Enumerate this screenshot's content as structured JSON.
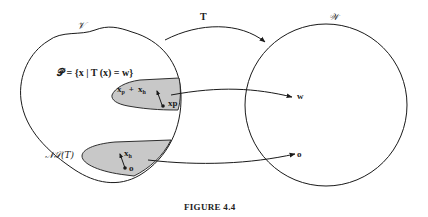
{
  "figure": {
    "caption": "FIGURE 4.4"
  },
  "domain_set": {
    "label": "𝒱",
    "solution_set_definition": "𝒫 = {x | T (x) = w}",
    "solution_region": {
      "vector_label": "x",
      "vector_label_sub_p": "p",
      "plus": "+",
      "vector_label_2": "x",
      "vector_label_sub_h": "h",
      "point_label": "xp"
    },
    "null_space": {
      "label": "𝒩𝒮(T)",
      "vector_label": "x",
      "vector_label_sub": "h",
      "point_label": "o"
    }
  },
  "codomain_set": {
    "label": "𝒲",
    "point_w": "w",
    "point_o": "o"
  },
  "mapping": {
    "label": "T"
  },
  "colors": {
    "stroke": "#1a1a1a",
    "region_fill": "#c8c8c8",
    "background": "#ffffff"
  }
}
